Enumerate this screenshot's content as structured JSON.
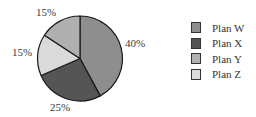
{
  "chart_data": {
    "type": "pie",
    "title": "",
    "categories": [
      "Plan W",
      "Plan X",
      "Plan Y",
      "Plan Z"
    ],
    "values": [
      40,
      25,
      15,
      15
    ],
    "value_labels": [
      "40%",
      "25%",
      "15%",
      "15%"
    ],
    "colors": [
      "#8e8e8e",
      "#555555",
      "#b0b0b0",
      "#dadada"
    ],
    "slice_order_clockwise_from_top": [
      "Plan W",
      "Plan X",
      "Plan Z",
      "Plan Y"
    ],
    "legend_position": "right"
  },
  "labels": {
    "w": "40%",
    "x": "25%",
    "y": "15%",
    "z": "15%"
  },
  "legend": {
    "items": [
      {
        "label": "Plan W",
        "color": "#8e8e8e"
      },
      {
        "label": "Plan X",
        "color": "#555555"
      },
      {
        "label": "Plan Y",
        "color": "#b0b0b0"
      },
      {
        "label": "Plan Z",
        "color": "#dadada"
      }
    ]
  }
}
